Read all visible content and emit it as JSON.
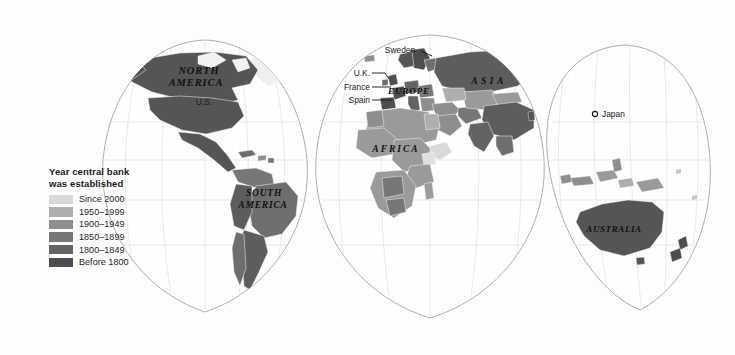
{
  "figure": {
    "type": "choropleth-world-map",
    "projection": "interrupted Goode homolosine",
    "background_color": "#fdfdfd",
    "graticule_color": "#d8d8d8",
    "outline_color": "#9a9a9a",
    "no_data_color": "#f2f2f2"
  },
  "legend": {
    "title": "Year central bank\nwas established",
    "items": [
      {
        "label": "Since 2000",
        "color": "#d9d9d9"
      },
      {
        "label": "1950–1999",
        "color": "#aeaeae"
      },
      {
        "label": "1900–1949",
        "color": "#8e8e8e"
      },
      {
        "label": "1850–1899",
        "color": "#777777"
      },
      {
        "label": "1800–1849",
        "color": "#636363"
      },
      {
        "label": "Before 1800",
        "color": "#4d4d4d"
      }
    ]
  },
  "continent_labels": [
    {
      "name": "north-america",
      "text": "NORTH",
      "x": 199,
      "y": 74,
      "size": 10.5,
      "spacing": 0.9
    },
    {
      "name": "north-america",
      "text": "AMERICA",
      "x": 196,
      "y": 86,
      "size": 10.5,
      "spacing": 0.9
    },
    {
      "name": "south-america",
      "text": "SOUTH",
      "x": 264,
      "y": 196,
      "size": 9.5,
      "spacing": 0.8
    },
    {
      "name": "south-america",
      "text": "AMERICA",
      "x": 263,
      "y": 208,
      "size": 9.5,
      "spacing": 0.8
    },
    {
      "name": "africa",
      "text": "AFRICA",
      "x": 396,
      "y": 152,
      "size": 9.5,
      "spacing": 2.0
    },
    {
      "name": "europe",
      "text": "EUROPE",
      "x": 409,
      "y": 94,
      "size": 9.0,
      "spacing": 0.9
    },
    {
      "name": "asia",
      "text": "ASIA",
      "x": 489,
      "y": 84,
      "size": 9.5,
      "spacing": 3.4
    },
    {
      "name": "australia",
      "text": "AUSTRALIA",
      "x": 614,
      "y": 232,
      "size": 9.0,
      "spacing": 0.6
    }
  ],
  "country_callouts": [
    {
      "name": "us",
      "text": "U.S.",
      "tx": 204,
      "ty": 105,
      "anchor": "middle",
      "line": null
    },
    {
      "name": "sweden",
      "text": "Sweden",
      "tx": 400,
      "ty": 53,
      "anchor": "middle",
      "line": "M 421 51 L 432 56"
    },
    {
      "name": "uk",
      "text": "U.K.",
      "tx": 370,
      "ty": 76,
      "anchor": "end",
      "line": "M 372 73 L 385 73 L 389 79"
    },
    {
      "name": "france",
      "text": "France",
      "tx": 370,
      "ty": 90,
      "anchor": "end",
      "line": "M 372 87 L 391 87"
    },
    {
      "name": "spain",
      "text": "Spain",
      "tx": 370,
      "ty": 103,
      "anchor": "end",
      "line": "M 372 100 L 392 100"
    },
    {
      "name": "japan",
      "text": "Japan",
      "tx": 602,
      "ty": 117,
      "anchor": "start",
      "line": null,
      "marker": {
        "cx": 595,
        "cy": 114,
        "r": 2.6
      }
    }
  ]
}
